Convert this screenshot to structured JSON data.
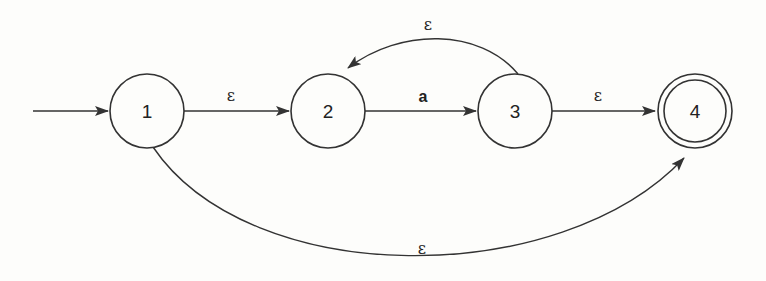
{
  "diagram": {
    "type": "NFA state diagram",
    "states": [
      {
        "id": "1",
        "label": "1",
        "start": true,
        "accept": false
      },
      {
        "id": "2",
        "label": "2",
        "start": false,
        "accept": false
      },
      {
        "id": "3",
        "label": "3",
        "start": false,
        "accept": false
      },
      {
        "id": "4",
        "label": "4",
        "start": false,
        "accept": true
      }
    ],
    "transitions": [
      {
        "from": "1",
        "to": "2",
        "label": "ε"
      },
      {
        "from": "2",
        "to": "3",
        "label": "a"
      },
      {
        "from": "3",
        "to": "4",
        "label": "ε"
      },
      {
        "from": "3",
        "to": "2",
        "label": "ε"
      },
      {
        "from": "1",
        "to": "4",
        "label": "ε"
      }
    ],
    "colors": {
      "stroke": "#333333",
      "background": "#fdfdfb"
    }
  }
}
